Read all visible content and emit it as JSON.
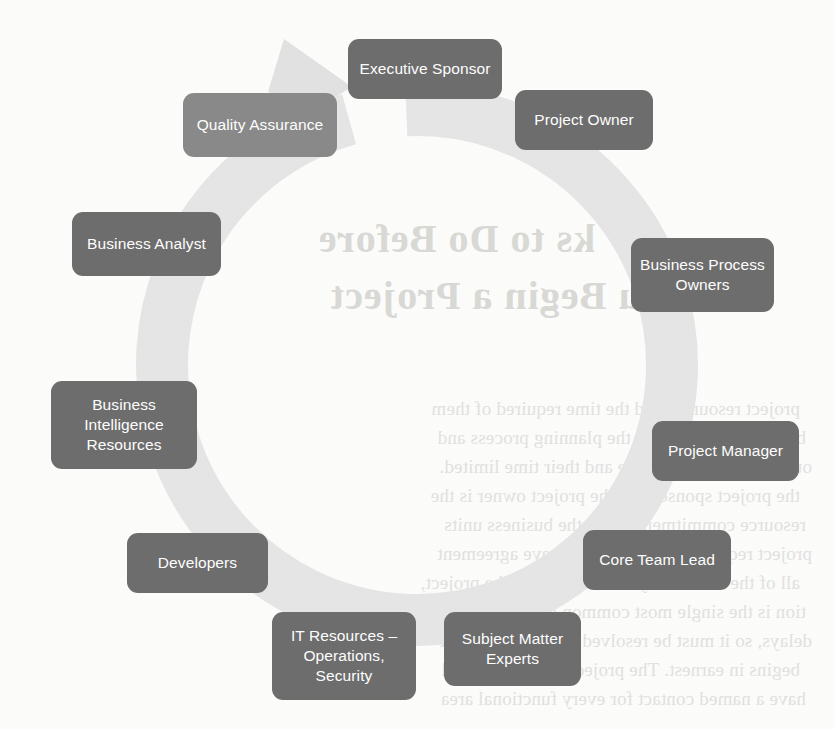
{
  "diagram": {
    "type": "cycle",
    "ring_color": "#e6e6e6",
    "box_color": "#6e6e6e",
    "box_color_light": "#8a8a8a",
    "text_color": "#ffffff",
    "arrow_direction": "clockwise",
    "node_count": 10,
    "nodes": [
      {
        "label": "Executive Sponsor",
        "lines": [
          "Executive Sponsor"
        ],
        "shade": "dark",
        "x": 348,
        "y": 39,
        "w": 154,
        "h": 60,
        "angle_deg": 0
      },
      {
        "label": "Project Owner",
        "lines": [
          "Project Owner"
        ],
        "shade": "dark",
        "x": 515,
        "y": 90,
        "w": 138,
        "h": 60,
        "angle_deg": 36
      },
      {
        "label": "Business Process Owners",
        "lines": [
          "Business Process",
          "Owners"
        ],
        "shade": "dark",
        "x": 631,
        "y": 238,
        "w": 143,
        "h": 74,
        "angle_deg": 72
      },
      {
        "label": "Project Manager",
        "lines": [
          "Project Manager"
        ],
        "shade": "dark",
        "x": 652,
        "y": 421,
        "w": 147,
        "h": 60,
        "angle_deg": 108
      },
      {
        "label": "Core Team Lead",
        "lines": [
          "Core Team Lead"
        ],
        "shade": "dark",
        "x": 583,
        "y": 530,
        "w": 148,
        "h": 60,
        "angle_deg": 144
      },
      {
        "label": "Subject Matter Experts",
        "lines": [
          "Subject Matter",
          "Experts"
        ],
        "shade": "dark",
        "x": 444,
        "y": 612,
        "w": 137,
        "h": 74,
        "angle_deg": 180
      },
      {
        "label": "IT Resources – Operations, Security",
        "lines": [
          "IT Resources –",
          "Operations,",
          "Security"
        ],
        "shade": "dark",
        "x": 272,
        "y": 612,
        "w": 144,
        "h": 88,
        "angle_deg": 216
      },
      {
        "label": "Developers",
        "lines": [
          "Developers"
        ],
        "shade": "dark",
        "x": 127,
        "y": 533,
        "w": 141,
        "h": 60,
        "angle_deg": 252
      },
      {
        "label": "Business Intelligence Resources",
        "lines": [
          "Business",
          "Intelligence",
          "Resources"
        ],
        "shade": "dark",
        "x": 51,
        "y": 381,
        "w": 146,
        "h": 88,
        "angle_deg": 288
      },
      {
        "label": "Business Analyst",
        "lines": [
          "Business Analyst"
        ],
        "shade": "dark",
        "x": 72,
        "y": 212,
        "w": 149,
        "h": 64,
        "angle_deg": 324
      },
      {
        "label": "Quality Assurance",
        "lines": [
          "Quality Assurance"
        ],
        "shade": "light",
        "x": 183,
        "y": 93,
        "w": 154,
        "h": 64,
        "angle_deg": 350
      }
    ]
  },
  "background_bleed": {
    "note": "mirrored show-through text from the reverse side of the printed page",
    "title_line_1": "ks to Do Before",
    "title_line_2": "You Begin a Project",
    "body_lines": [
      "project resources and the time required of them",
      "be committed early in the planning process and",
      "ources are usually scarce and their time limited.",
      "the project sponsor and the project owner is the",
      "resource commitments from the business units",
      "project requires. Make sure you have agreement",
      "all of the resources you will need for the project,",
      "tion is the single most common cause of project",
      "delays, so it must be resolved before the project",
      "begins in earnest. The project manager should",
      "have a named contact for every functional area"
    ]
  }
}
